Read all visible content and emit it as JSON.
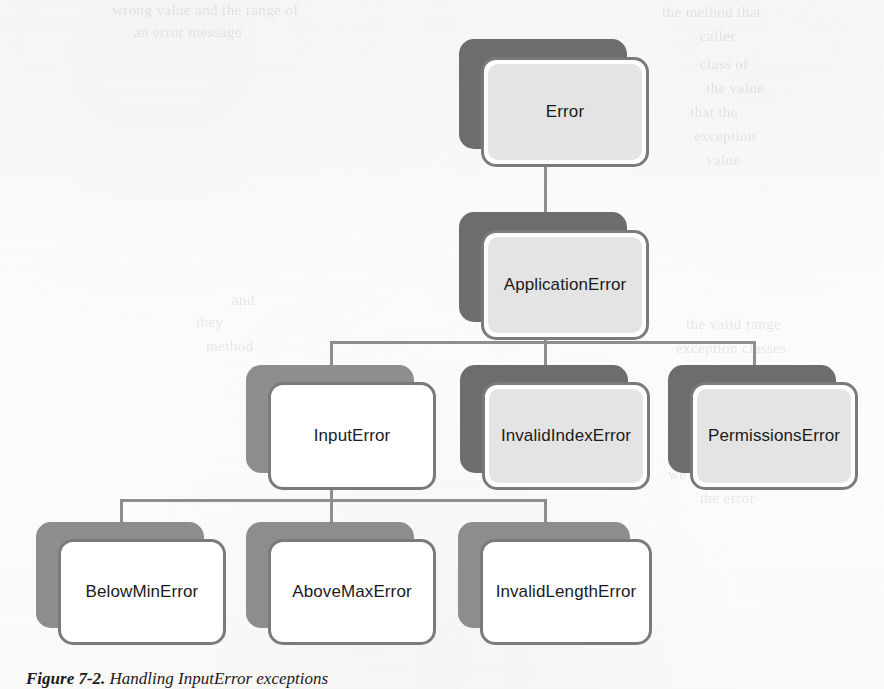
{
  "page": {
    "background_color": "#fdfdfc",
    "width": 884,
    "height": 689
  },
  "figure": {
    "caption_number": "Figure 7-2.",
    "caption_text": "Handling InputError exceptions",
    "type": "class-hierarchy-diagram",
    "shadow_color": "#6d6d6d",
    "shadow_color_light": "#8d8d8d",
    "border_color": "#7a7a7a",
    "fill_gray": "#e4e4e4",
    "fill_white": "#ffffff",
    "connector_color": "#8e8e8e"
  },
  "nodes": {
    "error": "Error",
    "application_error": "ApplicationError",
    "input_error": "InputError",
    "invalid_index_error": "InvalidIndexError",
    "permissions_error": "PermissionsError",
    "below_min_error": "BelowMinError",
    "above_max_error": "AboveMaxError",
    "invalid_length_error": "InvalidLengthError"
  },
  "ghost_text": {
    "tl1": "wrong value and the range of",
    "tl2": "an error message",
    "tr1": "the method that",
    "tr2": "caller",
    "r1": "class of",
    "r2": "the value",
    "r3": "that the",
    "r4": "exception",
    "r5": "value",
    "m1": "and",
    "m2": "they",
    "m3": "method",
    "m4": "the valid range",
    "m5": "exception classes",
    "b1": "we can report",
    "b2": "the error"
  }
}
